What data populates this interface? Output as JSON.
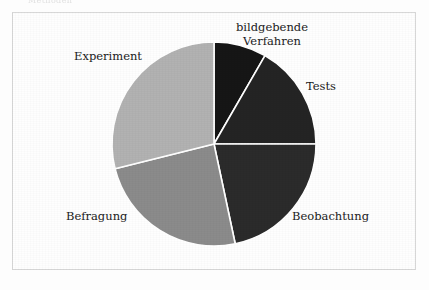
{
  "document": {
    "scan_header_text": "Methoden",
    "figure_border_color": "#d8d8d8",
    "page_background": "#fdfdfd"
  },
  "chart_data": {
    "type": "pie",
    "title": "",
    "subtitle": "",
    "xlabel": "",
    "ylabel": "",
    "legend_position": "none",
    "grid": false,
    "label_placement": "outside",
    "start_angle_deg": 0,
    "direction": "clockwise",
    "center": {
      "x": 214,
      "y": 144
    },
    "radius": 102,
    "separator_color": "#ffffff",
    "separator_width": 1.6,
    "categories": [
      "bildgebende Verfahren",
      "Tests",
      "Beobachtung",
      "Befragung",
      "Experiment"
    ],
    "values": [
      8.3,
      16.7,
      21.7,
      24.4,
      28.9
    ],
    "colors": [
      "#161616",
      "#242424",
      "#2b2b2b",
      "#8b8b8b",
      "#b2b2b2"
    ],
    "slices": [
      {
        "label": "bildgebende Verfahren",
        "value": 8.3,
        "start_deg": 0,
        "end_deg": 30,
        "color": "#161616",
        "label_lines": [
          "bildgebende",
          "Verfahren"
        ]
      },
      {
        "label": "Tests",
        "value": 16.7,
        "start_deg": 30,
        "end_deg": 90,
        "color": "#242424",
        "label_lines": [
          "Tests"
        ]
      },
      {
        "label": "Beobachtung",
        "value": 21.7,
        "start_deg": 90,
        "end_deg": 168,
        "color": "#2b2b2b",
        "label_lines": [
          "Beobachtung"
        ]
      },
      {
        "label": "Befragung",
        "value": 24.4,
        "start_deg": 168,
        "end_deg": 256,
        "color": "#8b8b8b",
        "label_lines": [
          "Befragung"
        ]
      },
      {
        "label": "Experiment",
        "value": 28.9,
        "start_deg": 256,
        "end_deg": 360,
        "color": "#b2b2b2",
        "label_lines": [
          "Experiment"
        ]
      }
    ]
  },
  "labels": {
    "bildgebende_line1": "bildgebende",
    "bildgebende_line2": "Verfahren",
    "tests": "Tests",
    "beobachtung": "Beobachtung",
    "befragung": "Befragung",
    "experiment": "Experiment"
  }
}
